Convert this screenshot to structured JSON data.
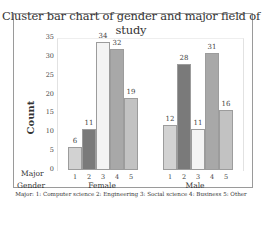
{
  "chart_data": {
    "type": "bar",
    "title": "Cluster bar chart of gender and major field of study",
    "xlabel": "Major / Gender",
    "ylabel": "Count",
    "ylim": [
      0,
      35
    ],
    "yticks": [
      "0",
      "5",
      "10",
      "15",
      "20",
      "25",
      "30",
      "35"
    ],
    "groups": [
      "Female",
      "Male"
    ],
    "categories": [
      "1",
      "2",
      "3",
      "4",
      "5"
    ],
    "series": [
      {
        "name": "Female",
        "values": [
          6,
          11,
          34,
          32,
          19
        ]
      },
      {
        "name": "Male",
        "values": [
          12,
          28,
          11,
          31,
          16
        ]
      }
    ],
    "bar_colors": [
      "#d2d2d2",
      "#7a7a7a",
      "#f4f4f4",
      "#a8a8a8",
      "#c2c2c2"
    ],
    "grid": false,
    "legend_note": "Major: 1: Computer science 2: Engineering 3: Social science 4: Business 5: Other"
  },
  "labels": {
    "major_row": "Major",
    "gender_row": "Gender"
  }
}
